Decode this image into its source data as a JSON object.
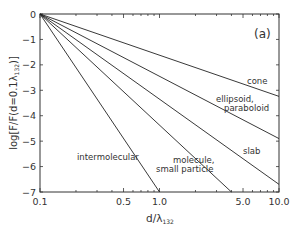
{
  "chart_data": {
    "type": "line",
    "title": "",
    "panel_label": "(a)",
    "xlabel": "d/λ",
    "xlabel_sub": "132",
    "ylabel": "log[F/F(d=0.1λ",
    "ylabel_sub": "132",
    "ylabel_end": ")]",
    "xscale": "log",
    "xlim": [
      0.1,
      10.0
    ],
    "ylim": [
      -7,
      0
    ],
    "x_ticks": [
      0.1,
      0.5,
      1.0,
      5.0,
      10.0
    ],
    "x_tick_labels": [
      "0.1",
      "0.5",
      "1.0",
      "5.0",
      "10.0"
    ],
    "y_ticks": [
      0,
      -1,
      -2,
      -3,
      -4,
      -5,
      -6,
      -7
    ],
    "y_tick_labels": [
      "0",
      "−1",
      "−2",
      "−3",
      "−4",
      "−5",
      "−6",
      "−7"
    ],
    "grid": false,
    "legend": "inline labels",
    "series": [
      {
        "name": "cone",
        "slope_per_decade": -1.62,
        "x": [
          0.1,
          10.0
        ],
        "y": [
          0,
          -3.24
        ],
        "label_lines": [
          "cone"
        ]
      },
      {
        "name": "ellipsoid, paraboloid",
        "slope_per_decade": -2.45,
        "x": [
          0.1,
          10.0
        ],
        "y": [
          0,
          -4.9
        ],
        "label_lines": [
          "ellipsoid,",
          "paraboloid"
        ]
      },
      {
        "name": "slab",
        "slope_per_decade": -3.35,
        "x": [
          0.1,
          10.0
        ],
        "y": [
          0,
          -6.7
        ],
        "label_lines": [
          "slab"
        ]
      },
      {
        "name": "molecule, small particle",
        "slope_per_decade": -4.35,
        "x": [
          0.1,
          4.0
        ],
        "y": [
          0,
          -7
        ],
        "label_lines": [
          "molecule,",
          "small particle"
        ]
      },
      {
        "name": "intermolecular",
        "slope_per_decade": -7.0,
        "x": [
          0.1,
          1.0
        ],
        "y": [
          0,
          -7
        ],
        "label_lines": [
          "intermolecular"
        ]
      }
    ]
  }
}
